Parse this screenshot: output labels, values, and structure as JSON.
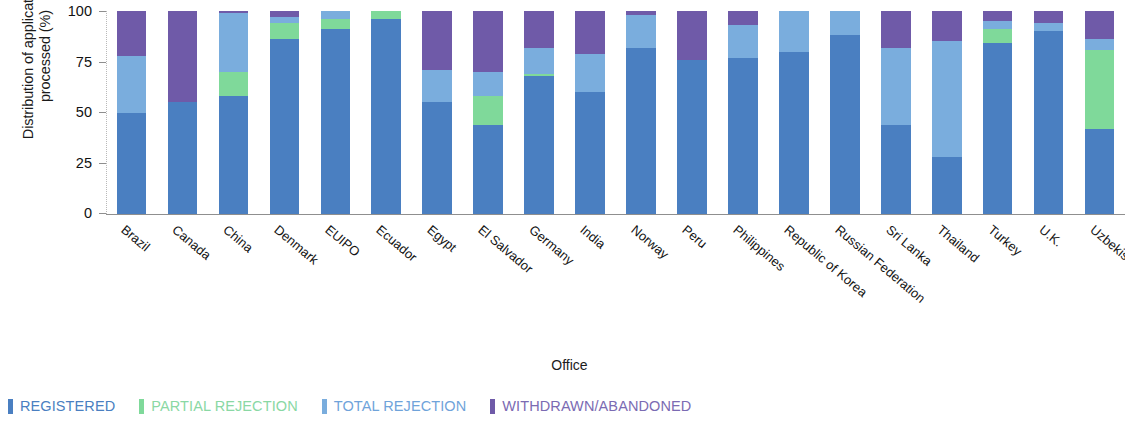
{
  "chart_data": {
    "type": "bar",
    "stacked": true,
    "title": "",
    "xlabel": "Office",
    "ylabel": "Distribution of applications\nprocessed (%)",
    "ylim": [
      0,
      100
    ],
    "yticks": [
      0,
      25,
      50,
      75,
      100
    ],
    "grid": false,
    "legend_position": "bottom-left",
    "categories": [
      "Brazil",
      "Canada",
      "China",
      "Denmark",
      "EUIPO",
      "Ecuador",
      "Egypt",
      "El Salvador",
      "Germany",
      "India",
      "Norway",
      "Peru",
      "Philippines",
      "Republic of Korea",
      "Russian Federation",
      "Sri Lanka",
      "Thailand",
      "Turkey",
      "U.K.",
      "Uzbekistan"
    ],
    "series": [
      {
        "name": "REGISTERED",
        "color": "#4a7fc1",
        "values": [
          50,
          55,
          58,
          86,
          91,
          96,
          55,
          44,
          68,
          60,
          82,
          76,
          77,
          80,
          88,
          44,
          28,
          84,
          90,
          42
        ]
      },
      {
        "name": "PARTIAL REJECTION",
        "color": "#7fd99a",
        "values": [
          0,
          0,
          12,
          8,
          5,
          4,
          0,
          14,
          1,
          0,
          0,
          0,
          0,
          0,
          0,
          0,
          0,
          7,
          0,
          39
        ]
      },
      {
        "name": "TOTAL REJECTION",
        "color": "#7aaddd",
        "values": [
          28,
          0,
          29,
          3,
          4,
          0,
          16,
          12,
          13,
          19,
          16,
          0,
          16,
          20,
          12,
          38,
          57,
          4,
          4,
          5
        ]
      },
      {
        "name": "WITHDRAWN/ABANDONED",
        "color": "#6f5aa8",
        "values": [
          22,
          45,
          1,
          3,
          0,
          0,
          29,
          30,
          18,
          21,
          2,
          24,
          7,
          0,
          0,
          18,
          15,
          5,
          6,
          14
        ]
      }
    ]
  },
  "axes": {
    "y_title": "Distribution of applications\nprocessed (%)",
    "y_ticks": [
      "100",
      "75",
      "50",
      "25",
      "0"
    ],
    "x_title": "Office"
  },
  "legend": {
    "items": [
      {
        "label": "REGISTERED",
        "color": "#4a7fc1",
        "text_color": "#4a7fc1"
      },
      {
        "label": "PARTIAL REJECTION",
        "color": "#7fd99a",
        "text_color": "#8ad8a4"
      },
      {
        "label": "TOTAL REJECTION",
        "color": "#7aaddd",
        "text_color": "#6fa3da"
      },
      {
        "label": "WITHDRAWN/ABANDONED",
        "color": "#6f5aa8",
        "text_color": "#7b6bb3"
      }
    ]
  }
}
